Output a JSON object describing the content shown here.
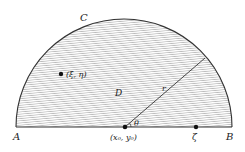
{
  "diagram": {
    "labels": {
      "A": "A",
      "B": "B",
      "C": "C",
      "D": "D",
      "r": "r",
      "theta": "θ",
      "point_xi_eta": "(ξ, η)",
      "center": "(x₀, y₀)",
      "zeta": "ζ"
    },
    "colors": {
      "outline": "#333333",
      "hatch": "#9a9a9a",
      "point": "#111111"
    }
  }
}
